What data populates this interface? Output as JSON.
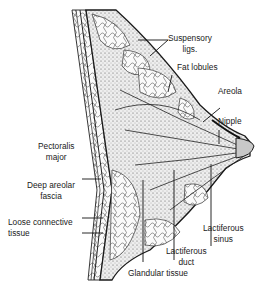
{
  "diagram": {
    "labels": {
      "suspensory_1": "Suspensory",
      "suspensory_2": "ligs.",
      "fat_lobules": "Fat lobules",
      "areola": "Areola",
      "nipple": "Nipple",
      "pectoralis_1": "Pectoralis",
      "pectoralis_2": "major",
      "deep_areolar_1": "Deep areolar",
      "deep_areolar_2": "fascia",
      "loose_1": "Loose connective",
      "loose_2": "tissue",
      "lact_sinus_1": "Lactiferous",
      "lact_sinus_2": "sinus",
      "lact_duct_1": "Lactiferous",
      "lact_duct_2": "duct",
      "glandular": "Glandular tissue"
    },
    "colors": {
      "ink": "#1a1a1a",
      "tissue": "#d8d8d8",
      "background": "#ffffff"
    }
  }
}
